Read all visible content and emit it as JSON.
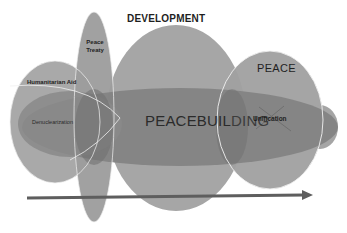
{
  "diagram": {
    "type": "overlapping-ellipses",
    "labels": {
      "development": "DEVELOPMENT",
      "peace": "PEACE",
      "peace_treaty_line1": "Peace",
      "peace_treaty_line2": "Treaty",
      "humanitarian_aid": "Humanitarian Aid",
      "denuclearization": "Denuclearization",
      "peacebuilding_head": "PEACEBUIL",
      "peacebuilding_tail": "DING",
      "unification": "Unification"
    },
    "shapes": [
      {
        "id": "development",
        "label": "DEVELOPMENT",
        "color": "#a3a3a3"
      },
      {
        "id": "peace",
        "label": "PEACE",
        "color": "#9d9d9d"
      },
      {
        "id": "peace-treaty",
        "label": "Peace Treaty",
        "color": "#9a9a9a"
      },
      {
        "id": "humanitarian-aid",
        "label": "Humanitarian Aid",
        "color": "#a8a8a8"
      },
      {
        "id": "peacebuilding",
        "label": "PEACEBUILDING",
        "color": "#7e7e7e"
      },
      {
        "id": "denuclearization",
        "label": "Denuclearization",
        "color": "#858585"
      }
    ],
    "crossed_out": "Unification",
    "arrow": {
      "direction": "right",
      "color": "#5e5e5e"
    }
  }
}
